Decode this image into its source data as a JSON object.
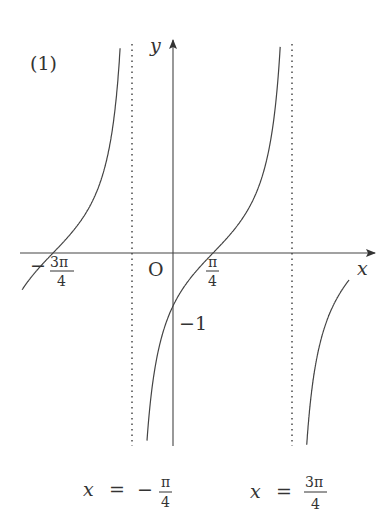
{
  "figure": {
    "panel_label": "(1)",
    "x_axis_label": "x",
    "y_axis_label": "y",
    "origin_label": "O",
    "line_color": "#444444",
    "asymptote_color": "#555555"
  },
  "labels": {
    "neg_3pi_4": {
      "sign": "−",
      "num": "3π",
      "den": "4"
    },
    "pi_4": {
      "num": "π",
      "den": "4"
    },
    "y_intercept": "−1",
    "asymptote_left": {
      "lhs": "x",
      "eq": "=",
      "sign": "−",
      "num": "π",
      "den": "4"
    },
    "asymptote_right": {
      "lhs": "x",
      "eq": "=",
      "num": "3π",
      "den": "4"
    }
  },
  "chart_data": {
    "type": "line",
    "title": "(1)",
    "function": "y = tan(x − π/4)",
    "xlabel": "x",
    "ylabel": "y",
    "x_ticks": [
      "−3π/4",
      "π/4"
    ],
    "y_ticks": [
      "−1"
    ],
    "asymptotes": [
      "x = −π/4",
      "x = 3π/4"
    ],
    "zeros": [
      "−3π/4",
      "π/4"
    ],
    "y_intercept": -1,
    "branches": [
      {
        "x_from": "−5π/4 (clipped)",
        "x_to": "−π/4",
        "passes_through": [
          [
            "−3π/4",
            0
          ]
        ]
      },
      {
        "x_from": "−π/4",
        "x_to": "3π/4",
        "passes_through": [
          [
            "0",
            -1
          ],
          [
            "π/4",
            0
          ]
        ]
      },
      {
        "x_from": "3π/4",
        "x_to": "clipped",
        "passes_through": []
      }
    ],
    "grid": false,
    "legend": null
  }
}
